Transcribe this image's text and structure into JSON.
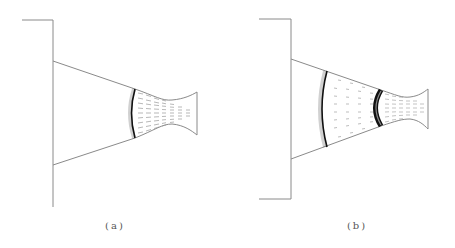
{
  "figure": {
    "panels": [
      {
        "id": "a",
        "caption": "(a)",
        "description": "Single shock front near nozzle inlet"
      },
      {
        "id": "b",
        "caption": "(b)",
        "description": "Two shock fronts: one in cone, one near nozzle inlet"
      }
    ]
  },
  "colors": {
    "outline": "#8a8a8a",
    "shock": "#111111",
    "vectors": "#9a9a9a",
    "background": "#ffffff"
  }
}
